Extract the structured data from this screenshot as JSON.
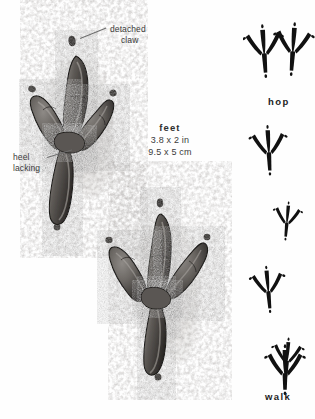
{
  "plate": {
    "background_color": "#fefefe",
    "ink_color": "#1c1c1c",
    "label_color": "#3b3b3b"
  },
  "annotations": {
    "detached_claw": {
      "line1": "detached",
      "line2": "claw"
    },
    "heel": {
      "line1": "heel",
      "line2": "lacking"
    }
  },
  "measurements": {
    "title": "feet",
    "imperial": "3.8 x 2 in",
    "metric": "9.5 x 5 cm"
  },
  "gaits": [
    {
      "name": "hop",
      "label": "hop",
      "tracks": 2,
      "arrangement": "paired-side-by-side"
    },
    {
      "name": "walk",
      "label": "walk",
      "tracks": 4,
      "arrangement": "alternating-single-file"
    }
  ],
  "prints": [
    {
      "name": "upper-left-print",
      "toes": 4,
      "shows": "detached claw marks, no heel"
    },
    {
      "name": "lower-center-print",
      "toes": 4,
      "shows": "detached claw marks, no heel"
    }
  ]
}
